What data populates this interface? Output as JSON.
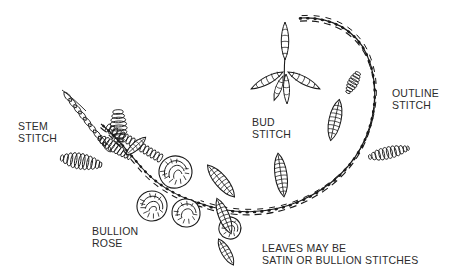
{
  "figure": {
    "type": "embroidery-stitch-diagram",
    "background_color": "#ffffff",
    "ink_color": "#1a1a1a",
    "text_color": "#2b2b2b",
    "width": 462,
    "height": 275
  },
  "labels": {
    "stem": "STEM\nSTITCH",
    "bullion_rose": "BULLION\nROSE",
    "bud": "BUD\nSTITCH",
    "outline": "OUTLINE\nSTITCH",
    "leaves": "LEAVES MAY BE\nSATIN OR BULLION STITCHES"
  },
  "elements": {
    "stem_stitch_label": "STEM STITCH",
    "bullion_rose_label": "BULLION ROSE",
    "bud_stitch_label": "BUD STITCH",
    "outline_stitch_label": "OUTLINE STITCH",
    "leaves_caption_label": "LEAVES MAY BE SATIN OR BULLION STITCHES"
  }
}
